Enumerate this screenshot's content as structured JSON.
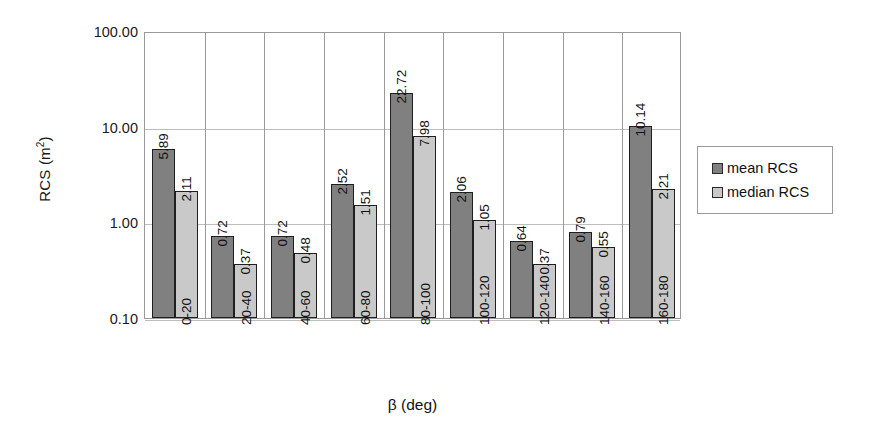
{
  "chart_data": {
    "type": "bar",
    "title": "",
    "xlabel": "β (deg)",
    "ylabel": "RCS (m²)",
    "ylabel_base": "RCS (m",
    "ylabel_sup": "2",
    "ylabel_tail": ")",
    "yscale": "log",
    "ylim": [
      0.1,
      100
    ],
    "ytick_labels": [
      "100.00",
      "10.00",
      "1.00",
      "0.10"
    ],
    "ytick_values": [
      100,
      10,
      1,
      0.1
    ],
    "grid": "horizontal-and-category",
    "legend_position": "right",
    "categories": [
      "0-20",
      "20-40",
      "40-60",
      "60-80",
      "80-100",
      "100-120",
      "120-140",
      "140-160",
      "160-180"
    ],
    "series": [
      {
        "name": "mean RCS",
        "color": "#808080",
        "values": [
          5.89,
          0.72,
          0.72,
          2.52,
          22.72,
          2.06,
          0.64,
          0.79,
          10.14
        ],
        "labels": [
          "5.89",
          "0.72",
          "0.72",
          "2.52",
          "22.72",
          "2.06",
          "0.64",
          "0.79",
          "10.14"
        ]
      },
      {
        "name": "median RCS",
        "color": "#c9c9c9",
        "values": [
          2.11,
          0.37,
          0.48,
          1.51,
          7.98,
          1.05,
          0.37,
          0.55,
          2.21
        ],
        "labels": [
          "2.11",
          "0.37",
          "0.48",
          "1.51",
          "7.98",
          "1.05",
          "0.37",
          "0.55",
          "2.21"
        ]
      }
    ]
  },
  "legend": {
    "items": [
      {
        "label": "mean RCS",
        "swatch": "mean"
      },
      {
        "label": "median RCS",
        "swatch": "median"
      }
    ]
  }
}
